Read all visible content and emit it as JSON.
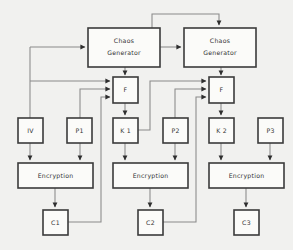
{
  "diagram": {
    "background_color": "#f1f1ef",
    "node_fill": "#fbfbf9",
    "node_stroke": "#3b3b3b",
    "wire_color": "#8a8a8a",
    "nodes": {
      "chaos_generator_1": {
        "label_line1": "Chaos",
        "label_line2": "Generator"
      },
      "chaos_generator_2": {
        "label_line1": "Chaos",
        "label_line2": "Generator"
      },
      "f1": {
        "label": "F"
      },
      "f2": {
        "label": "F"
      },
      "iv": {
        "label": "IV"
      },
      "p1": {
        "label": "P1"
      },
      "k1": {
        "label": "K 1"
      },
      "p2": {
        "label": "P2"
      },
      "k2": {
        "label": "K 2"
      },
      "p3": {
        "label": "P3"
      },
      "encryption_1": {
        "label": "Encryption"
      },
      "encryption_2": {
        "label": "Encryption"
      },
      "encryption_3": {
        "label": "Encryption"
      },
      "c1": {
        "label": "C1"
      },
      "c2": {
        "label": "C2"
      },
      "c3": {
        "label": "C3"
      }
    }
  }
}
